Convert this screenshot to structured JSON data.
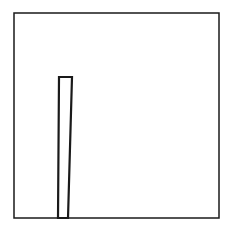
{
  "figure": {
    "background": "#ffffff",
    "stroke_color": "#1a1a1a",
    "frame": {
      "x": 14,
      "y": 13,
      "width": 205,
      "height": 205,
      "stroke_width": 1.5
    },
    "bar": {
      "points": "59,77 72,77 68,218 58,218",
      "stroke_width": 2.2,
      "fill": "#ffffff"
    }
  }
}
